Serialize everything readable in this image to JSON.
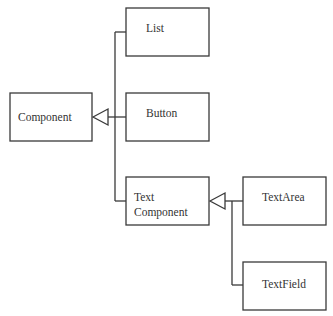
{
  "diagram": {
    "type": "class-hierarchy",
    "nodes": [
      {
        "id": "component",
        "label_lines": [
          "Component"
        ]
      },
      {
        "id": "list",
        "label_lines": [
          "List"
        ]
      },
      {
        "id": "button",
        "label_lines": [
          "Button"
        ]
      },
      {
        "id": "text-component",
        "label_lines": [
          "Text",
          "Component"
        ]
      },
      {
        "id": "text-area",
        "label_lines": [
          "TextArea"
        ]
      },
      {
        "id": "text-field",
        "label_lines": [
          "TextField"
        ]
      }
    ],
    "edges": [
      {
        "from": "list",
        "to": "component",
        "kind": "inheritance"
      },
      {
        "from": "button",
        "to": "component",
        "kind": "inheritance"
      },
      {
        "from": "text-component",
        "to": "component",
        "kind": "inheritance"
      },
      {
        "from": "text-area",
        "to": "text-component",
        "kind": "inheritance"
      },
      {
        "from": "text-field",
        "to": "text-component",
        "kind": "inheritance"
      }
    ]
  }
}
